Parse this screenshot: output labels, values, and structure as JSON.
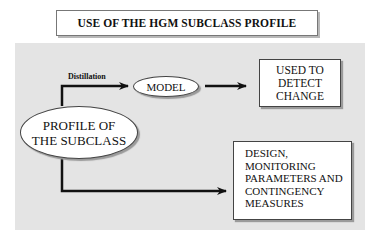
{
  "title": "USE OF THE HGM SUBCLASS PROFILE",
  "nodes": {
    "profile": [
      "PROFILE OF",
      "THE SUBCLASS"
    ],
    "model": "MODEL",
    "change": [
      "USED TO",
      "DETECT",
      "CHANGE"
    ],
    "design": [
      "DESIGN,",
      "MONITORING",
      "PARAMETERS AND",
      "CONTINGENCY",
      "MEASURES"
    ]
  },
  "edges": {
    "distillation_label": "Distillation"
  }
}
